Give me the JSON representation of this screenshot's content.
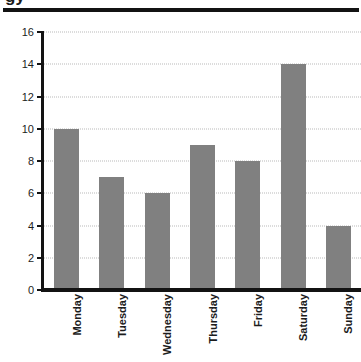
{
  "chart_data": {
    "type": "bar",
    "title": "",
    "xlabel": "",
    "ylabel": "",
    "categories": [
      "Monday",
      "Tuesday",
      "Wednesday",
      "Thursday",
      "Friday",
      "Saturday",
      "Sunday"
    ],
    "values": [
      10,
      7,
      6,
      9,
      8,
      14,
      4
    ],
    "ylim": [
      0,
      16
    ],
    "ytick_step": 2,
    "yticks": [
      0,
      2,
      4,
      6,
      8,
      10,
      12,
      14,
      16
    ],
    "ytick_labels": [
      "0",
      "2",
      "4",
      "6",
      "8",
      "10",
      "12",
      "14",
      "16"
    ],
    "grid": true,
    "grid_axis": "y",
    "grid_style": "dotted",
    "legend": false,
    "legend_position": "none",
    "bar_color": "#808080",
    "axis_color": "#131313",
    "gridline_color": "#b9b9b9",
    "text_color": "#1c1c1c",
    "background_color": "#ffffff",
    "xtick_label_rotation": 90
  },
  "axes": {
    "y_tick_labels": [
      "16",
      "14",
      "12",
      "10",
      "8",
      "6",
      "4",
      "2",
      "0"
    ]
  },
  "decor": {
    "title_descender_text": "gy",
    "top_rule": "horizontal-rule"
  }
}
